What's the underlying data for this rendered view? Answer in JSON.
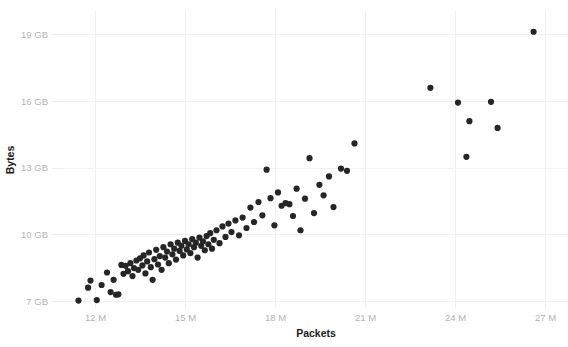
{
  "chart_data": {
    "type": "scatter",
    "title": "",
    "xlabel": "Packets",
    "ylabel": "Bytes",
    "xlim": [
      11000000,
      27600000
    ],
    "ylim": [
      6700000000,
      19400000000
    ],
    "grid": true,
    "legend": null,
    "x_tick_labels": [
      "12 M",
      "15 M",
      "18 M",
      "21 M",
      "24 M",
      "27 M"
    ],
    "x_tick_values": [
      12000000,
      15000000,
      18000000,
      21000000,
      24000000,
      27000000
    ],
    "y_tick_labels": [
      "7 GB",
      "10 GB",
      "13 GB",
      "16 GB",
      "19 GB"
    ],
    "y_tick_values": [
      7000000000,
      10000000000,
      13000000000,
      16000000000,
      19000000000
    ],
    "x_unit": "M",
    "y_unit": "GB",
    "marker_color": "#262626",
    "marker_size": 3.1,
    "grid_color": "#f1f1f1",
    "tick_label_color": "#b3b3b3",
    "axis_title_color": "#1a1a1a",
    "background_color": "#ffffff",
    "points": [
      [
        11.45,
        7.02
      ],
      [
        11.77,
        7.6
      ],
      [
        11.85,
        7.92
      ],
      [
        12.06,
        7.04
      ],
      [
        12.22,
        7.72
      ],
      [
        12.4,
        8.28
      ],
      [
        12.52,
        7.4
      ],
      [
        12.62,
        7.95
      ],
      [
        12.7,
        7.28
      ],
      [
        12.78,
        7.3
      ],
      [
        12.88,
        8.62
      ],
      [
        12.95,
        8.22
      ],
      [
        13.02,
        8.58
      ],
      [
        13.1,
        8.34
      ],
      [
        13.18,
        8.7
      ],
      [
        13.25,
        8.12
      ],
      [
        13.3,
        8.48
      ],
      [
        13.38,
        8.82
      ],
      [
        13.44,
        8.4
      ],
      [
        13.5,
        8.92
      ],
      [
        13.58,
        8.6
      ],
      [
        13.62,
        9.05
      ],
      [
        13.68,
        8.24
      ],
      [
        13.74,
        8.78
      ],
      [
        13.8,
        9.18
      ],
      [
        13.86,
        8.52
      ],
      [
        13.92,
        7.95
      ],
      [
        13.98,
        8.88
      ],
      [
        14.04,
        9.3
      ],
      [
        14.1,
        8.64
      ],
      [
        14.16,
        9.02
      ],
      [
        14.22,
        8.4
      ],
      [
        14.28,
        9.42
      ],
      [
        14.34,
        8.95
      ],
      [
        14.4,
        9.22
      ],
      [
        14.46,
        8.7
      ],
      [
        14.52,
        9.55
      ],
      [
        14.58,
        9.1
      ],
      [
        14.64,
        9.35
      ],
      [
        14.7,
        8.86
      ],
      [
        14.76,
        9.62
      ],
      [
        14.82,
        9.25
      ],
      [
        14.88,
        9.48
      ],
      [
        14.94,
        9.05
      ],
      [
        15.0,
        9.7
      ],
      [
        15.06,
        9.32
      ],
      [
        15.12,
        9.55
      ],
      [
        15.18,
        9.15
      ],
      [
        15.24,
        9.78
      ],
      [
        15.3,
        9.42
      ],
      [
        15.36,
        9.62
      ],
      [
        15.42,
        8.95
      ],
      [
        15.48,
        9.85
      ],
      [
        15.54,
        9.48
      ],
      [
        15.6,
        9.68
      ],
      [
        15.66,
        9.28
      ],
      [
        15.72,
        9.92
      ],
      [
        15.78,
        9.55
      ],
      [
        15.84,
        10.05
      ],
      [
        15.9,
        9.35
      ],
      [
        15.96,
        9.75
      ],
      [
        16.05,
        10.18
      ],
      [
        16.15,
        9.6
      ],
      [
        16.25,
        10.35
      ],
      [
        16.35,
        9.88
      ],
      [
        16.45,
        10.48
      ],
      [
        16.55,
        10.1
      ],
      [
        16.68,
        10.62
      ],
      [
        16.8,
        9.95
      ],
      [
        16.92,
        10.75
      ],
      [
        17.05,
        10.28
      ],
      [
        17.18,
        11.2
      ],
      [
        17.3,
        10.55
      ],
      [
        17.45,
        11.45
      ],
      [
        17.58,
        10.85
      ],
      [
        17.72,
        12.9
      ],
      [
        17.85,
        11.62
      ],
      [
        17.98,
        10.4
      ],
      [
        18.1,
        11.88
      ],
      [
        18.22,
        11.28
      ],
      [
        18.35,
        11.4
      ],
      [
        18.48,
        11.35
      ],
      [
        18.6,
        10.82
      ],
      [
        18.72,
        12.05
      ],
      [
        18.85,
        10.18
      ],
      [
        19.0,
        11.6
      ],
      [
        19.15,
        13.42
      ],
      [
        19.3,
        10.95
      ],
      [
        19.48,
        12.22
      ],
      [
        19.62,
        11.75
      ],
      [
        19.8,
        12.6
      ],
      [
        19.95,
        11.22
      ],
      [
        20.2,
        12.95
      ],
      [
        20.4,
        12.85
      ],
      [
        20.65,
        14.08
      ],
      [
        23.18,
        16.58
      ],
      [
        24.1,
        15.92
      ],
      [
        24.38,
        13.48
      ],
      [
        24.48,
        15.08
      ],
      [
        25.2,
        15.95
      ],
      [
        25.42,
        14.78
      ],
      [
        26.62,
        19.1
      ]
    ]
  },
  "footer": {
    "ghost_text": ""
  }
}
